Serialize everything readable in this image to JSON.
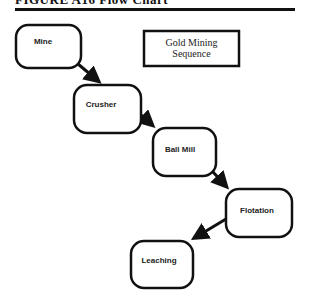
{
  "header": {
    "text": "FIGURE A16 Flow Chart"
  },
  "diagram": {
    "title_lines": [
      "Gold Mining",
      "Sequence"
    ],
    "nodes": [
      {
        "id": "mine",
        "label": "Mine"
      },
      {
        "id": "crusher",
        "label": "Crusher"
      },
      {
        "id": "ball-mill",
        "label": "Ball Mill"
      },
      {
        "id": "flotation",
        "label": "Flotation"
      },
      {
        "id": "leaching",
        "label": "Leaching"
      }
    ],
    "edges": [
      {
        "from": "mine",
        "to": "crusher"
      },
      {
        "from": "crusher",
        "to": "ball-mill"
      },
      {
        "from": "ball-mill",
        "to": "flotation"
      },
      {
        "from": "flotation",
        "to": "leaching"
      }
    ],
    "colors": {
      "stroke": "#111111",
      "background": "#ffffff"
    }
  }
}
